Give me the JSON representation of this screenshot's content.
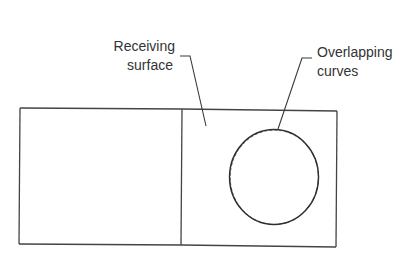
{
  "diagram": {
    "type": "schematic",
    "colors": {
      "background": "#ffffff",
      "line": "#3a3a3a",
      "text": "#333333"
    },
    "outer_rectangle": {
      "left": 20,
      "top": 108,
      "right": 337,
      "bottom": 247
    },
    "divider_x": 182,
    "circle": {
      "cx": 274,
      "cy": 177,
      "rx": 45,
      "ry": 48
    },
    "labels": [
      {
        "id": "receiving-surface",
        "lines": [
          "Receiving",
          "surface"
        ],
        "leader": {
          "tick": [
            [
              180,
              56
            ],
            [
              190,
              56
            ]
          ],
          "diagonal": [
            [
              190,
              56
            ],
            [
              206,
              126
            ]
          ]
        }
      },
      {
        "id": "overlapping-curves",
        "lines": [
          "Overlapping",
          "curves"
        ],
        "leader": {
          "tick": [
            [
              302,
              58
            ],
            [
              312,
              58
            ]
          ],
          "diagonal": [
            [
              302,
              58
            ],
            [
              278,
              129
            ]
          ]
        }
      }
    ]
  }
}
